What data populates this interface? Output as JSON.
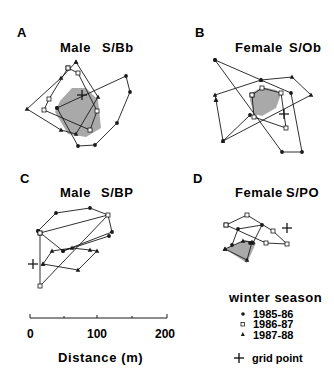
{
  "chart_data": {
    "type": "scatter",
    "panels": [
      {
        "letter": "A",
        "sex": "Male",
        "id": "S/Bb",
        "grid_point": [
          82,
          95
        ],
        "core_area": [
          [
            72,
            88
          ],
          [
            86,
            88
          ],
          [
            98,
            100
          ],
          [
            101,
            128
          ],
          [
            86,
            137
          ],
          [
            68,
            134
          ],
          [
            55,
            112
          ],
          [
            60,
            101
          ]
        ],
        "series": {
          "1985-86": [
            [
              57,
              108
            ],
            [
              126,
              76
            ],
            [
              130,
              92
            ],
            [
              117,
              123
            ],
            [
              95,
              145
            ],
            [
              78,
              146
            ],
            [
              57,
              108
            ]
          ],
          "1986-87": [
            [
              68,
              68
            ],
            [
              78,
              73
            ],
            [
              97,
              111
            ],
            [
              90,
              130
            ],
            [
              44,
              110
            ],
            [
              49,
              99
            ],
            [
              68,
              68
            ]
          ],
          "1987-88": [
            [
              76,
              62
            ],
            [
              61,
              78
            ],
            [
              27,
              109
            ],
            [
              61,
              130
            ],
            [
              76,
              134
            ],
            [
              98,
              97
            ],
            [
              76,
              62
            ]
          ]
        }
      },
      {
        "letter": "B",
        "sex": "Female",
        "id": "S/Ob",
        "grid_point": [
          284,
          114
        ],
        "core_area": [
          [
            252,
            93
          ],
          [
            262,
            87
          ],
          [
            276,
            90
          ],
          [
            281,
            94
          ],
          [
            276,
            108
          ],
          [
            262,
            116
          ],
          [
            254,
            114
          ],
          [
            250,
            100
          ]
        ],
        "series": {
          "1985-86": [
            [
              215,
              60
            ],
            [
              261,
              80
            ],
            [
              291,
              93
            ],
            [
              302,
              152
            ],
            [
              282,
              152
            ],
            [
              215,
              60
            ]
          ],
          "1986-87": [
            [
              252,
              95
            ],
            [
              262,
              88
            ],
            [
              281,
              93
            ],
            [
              286,
              128
            ],
            [
              254,
              117
            ],
            [
              252,
              95
            ]
          ],
          "1987-88": [
            [
              216,
              100
            ],
            [
              215,
              95
            ],
            [
              261,
              80
            ],
            [
              292,
              77
            ],
            [
              311,
              95
            ],
            [
              223,
              141
            ],
            [
              216,
              100
            ]
          ],
          "extra_1985-86": [
            [
              250,
              115
            ],
            [
              223,
              141
            ]
          ]
        }
      },
      {
        "letter": "C",
        "sex": "Male",
        "id": "S/BP",
        "grid_point": [
          33,
          264
        ],
        "core_area": [],
        "series": {
          "1985-86": [
            [
              38,
              231
            ],
            [
              56,
              213
            ],
            [
              90,
              208
            ],
            [
              108,
              215
            ],
            [
              112,
              232
            ],
            [
              63,
              251
            ],
            [
              38,
              231
            ]
          ],
          "1986-87": [
            [
              40,
              233
            ],
            [
              108,
              215
            ],
            [
              40,
              286
            ],
            [
              40,
              233
            ]
          ],
          "1987-88": [
            [
              43,
              264
            ],
            [
              52,
              251
            ],
            [
              72,
              248
            ],
            [
              90,
              250
            ],
            [
              97,
              251
            ],
            [
              78,
              270
            ],
            [
              43,
              264
            ]
          ],
          "extra_1985-86": [
            [
              109,
              236
            ],
            [
              63,
              251
            ]
          ]
        }
      },
      {
        "letter": "D",
        "sex": "Female",
        "id": "S/PO",
        "grid_point": [
          287,
          228
        ],
        "core_area": [
          [
            225,
            249
          ],
          [
            245,
            240
          ],
          [
            256,
            243
          ],
          [
            247,
            263
          ]
        ],
        "series": {
          "1985-86": [
            [
              232,
              245
            ],
            [
              238,
              229
            ],
            [
              262,
              225
            ],
            [
              253,
              243
            ],
            [
              250,
              243
            ]
          ],
          "1986-87": [
            [
              226,
              225
            ],
            [
              247,
              215
            ],
            [
              273,
              231
            ],
            [
              287,
              244
            ],
            [
              266,
              243
            ],
            [
              226,
              225
            ]
          ],
          "1987-88": [
            [
              225,
              249
            ],
            [
              243,
              241
            ],
            [
              252,
              242
            ],
            [
              247,
              260
            ],
            [
              225,
              249
            ]
          ]
        }
      }
    ],
    "scale_bar": {
      "label": "Distance (m)",
      "ticks": [
        "0",
        "100",
        "200"
      ],
      "range": [
        0,
        200
      ]
    },
    "legend": {
      "title": "winter season",
      "entries": [
        {
          "marker": "circle",
          "label": "1985-86"
        },
        {
          "marker": "square",
          "label": "1986-87"
        },
        {
          "marker": "triangle",
          "label": "1987-88"
        }
      ],
      "grid_point_label": "grid point"
    }
  },
  "panels": {
    "a": {
      "letter": "A",
      "sex": "Male",
      "id": "S/Bb"
    },
    "b": {
      "letter": "B",
      "sex": "Female",
      "id": "S/Ob"
    },
    "c": {
      "letter": "C",
      "sex": "Male",
      "id": "S/BP"
    },
    "d": {
      "letter": "D",
      "sex": "Female",
      "id": "S/PO"
    }
  },
  "scale": {
    "tick0": "0",
    "tick100": "100",
    "tick200": "200",
    "title": "Distance (m)"
  },
  "legend": {
    "title": "winter season",
    "item1": "1985-86",
    "item2": "1986-87",
    "item3": "1987-88",
    "grid": "grid point"
  },
  "colors": {
    "ink": "#1a1a1a",
    "core_fill": "#9a9a9a"
  }
}
